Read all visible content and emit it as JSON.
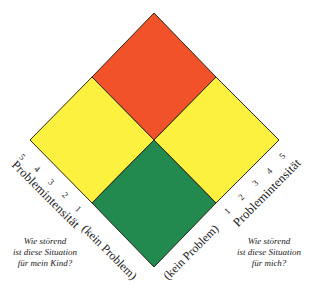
{
  "diagram": {
    "type": "diamond-matrix",
    "quadrants": [
      {
        "id": "top",
        "label": "beide stark gestört",
        "color": "#f2522a"
      },
      {
        "id": "left",
        "label": "Kind gestört",
        "color": "#fcf13e"
      },
      {
        "id": "right",
        "label": "ich gestört",
        "color": "#fcf13e"
      },
      {
        "id": "bottom",
        "label": "kein Problem",
        "color": "#238a4f"
      }
    ],
    "colors": {
      "red": "#f2522a",
      "yellow": "#fcf13e",
      "green": "#238a4f",
      "outline": "#2a2418"
    }
  },
  "left_axis": {
    "title": "Problemintensität",
    "ticks": [
      "1",
      "2",
      "3",
      "4",
      "5"
    ],
    "baseline_label": "(kein Problem)",
    "question_lines": [
      "Wie störend",
      "ist diese Situation",
      "für mein Kind?"
    ]
  },
  "right_axis": {
    "title": "Problemintensität",
    "ticks": [
      "1",
      "2",
      "3",
      "4",
      "5"
    ],
    "baseline_label": "(kein Problem)",
    "question_lines": [
      "Wie störend",
      "ist diese Situation",
      "für mich?"
    ]
  }
}
